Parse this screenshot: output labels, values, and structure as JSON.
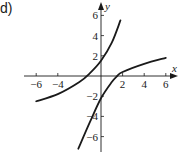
{
  "panel": {
    "label": "d)"
  },
  "chart_data": {
    "type": "line",
    "title": "",
    "xlabel": "x",
    "ylabel": "y",
    "xlim": [
      -6.5,
      6.5
    ],
    "ylim": [
      -6.5,
      6.5
    ],
    "x_ticks": [
      -6,
      -4,
      2,
      4,
      6
    ],
    "x_tick_labels": [
      "−6",
      "−4",
      "2",
      "4",
      "6"
    ],
    "y_ticks": [
      6,
      4,
      2,
      -2,
      -4,
      -6
    ],
    "y_tick_labels": [
      "6",
      "4",
      "2",
      "−2",
      "−4",
      "−6"
    ],
    "grid": false,
    "legend": null,
    "series": [
      {
        "name": "curve-left",
        "x": [
          -6,
          -4,
          -2,
          -1,
          0,
          1,
          1.8
        ],
        "y": [
          -2.5,
          -1.8,
          -0.6,
          0.3,
          1.5,
          3.3,
          5.5
        ]
      },
      {
        "name": "curve-right",
        "x": [
          -2.1,
          -1,
          0,
          1,
          1.5,
          2,
          4,
          6
        ],
        "y": [
          -7.2,
          -4.5,
          -2.2,
          -0.6,
          0,
          0.4,
          1.2,
          1.8
        ]
      }
    ],
    "line_color": "#1a1a1a"
  }
}
